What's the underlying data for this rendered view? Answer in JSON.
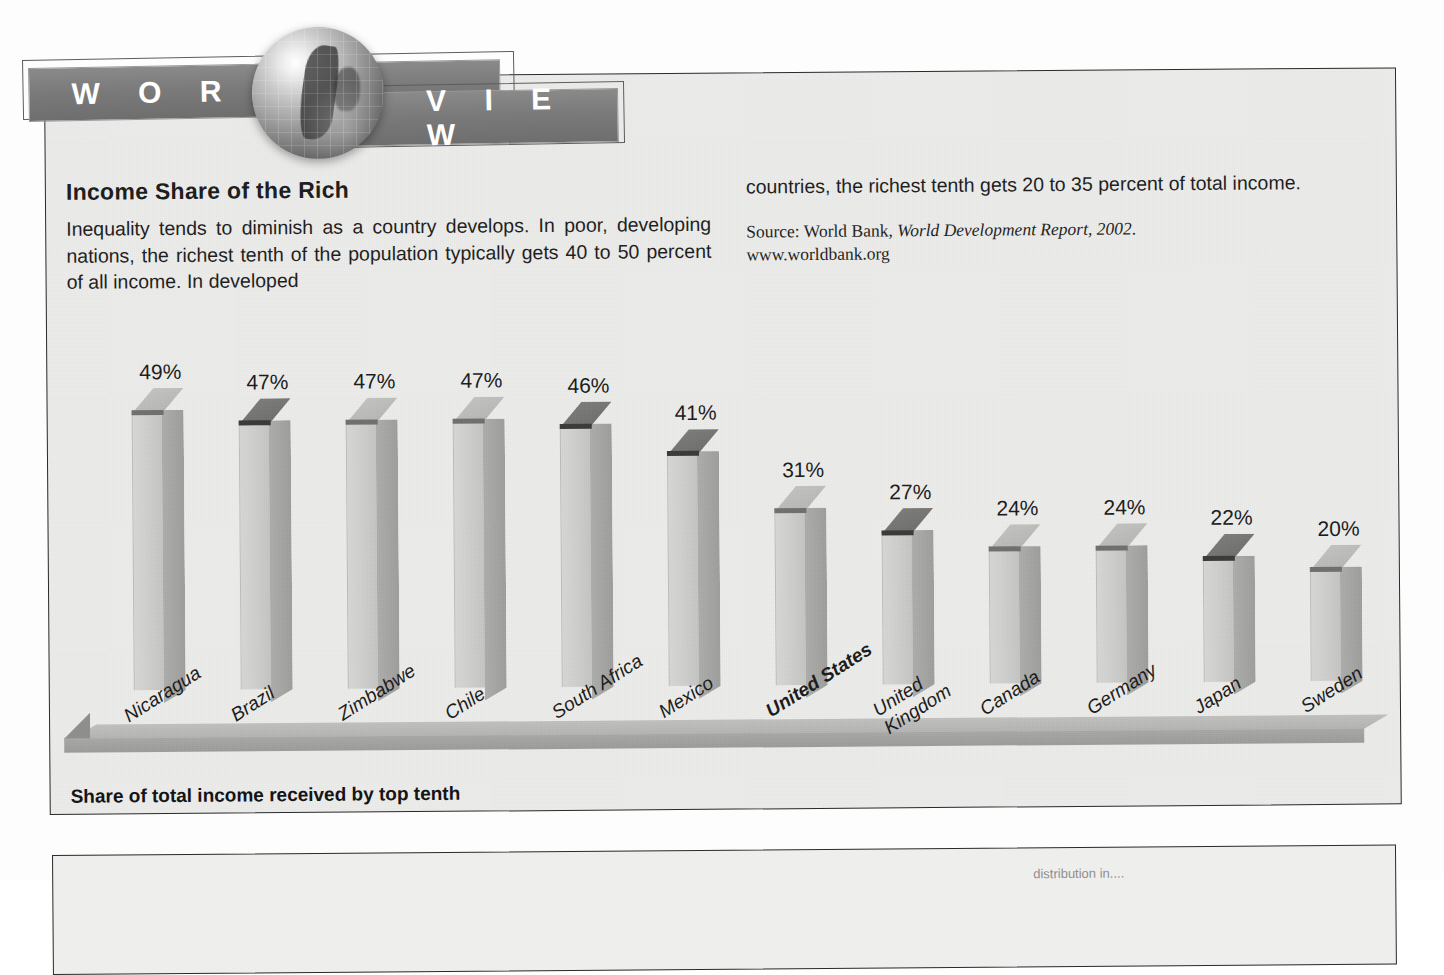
{
  "header": {
    "banner_left": "W O R L D",
    "banner_right": "V I E W",
    "globe_icon": "globe-icon"
  },
  "article": {
    "headline": "Income Share of the Rich",
    "lead_paragraph": "Inequality tends to diminish as a country develops. In poor, developing nations, the richest tenth of the population typically gets 40 to 50 percent of all income. In developed",
    "continuation": "countries, the richest tenth gets 20 to 35 percent of total income.",
    "source_prefix": "Source: World Bank, ",
    "source_title": "World Development Report, 2002",
    "source_suffix": ".",
    "source_url": "www.worldbank.org"
  },
  "chart_data": {
    "type": "bar",
    "title": "Income Share of the Rich",
    "xlabel": "",
    "ylabel": "Share of total income received by top tenth",
    "axis_caption": "Share of total income received by top tenth",
    "ylim": [
      0,
      50
    ],
    "grid": false,
    "legend": "none",
    "value_suffix": "%",
    "categories": [
      "Nicaragua",
      "Brazil",
      "Zimbabwe",
      "Chile",
      "South Africa",
      "Mexico",
      "United States",
      "United\nKingdom",
      "Canada",
      "Germany",
      "Japan",
      "Sweden"
    ],
    "values": [
      49,
      47,
      47,
      47,
      46,
      41,
      31,
      27,
      24,
      24,
      22,
      20
    ],
    "value_labels": [
      "49%",
      "47%",
      "47%",
      "47%",
      "46%",
      "41%",
      "31%",
      "27%",
      "24%",
      "24%",
      "22%",
      "20%"
    ],
    "highlighted_category": "United States",
    "top_face_shade": [
      "light",
      "dark",
      "light",
      "light",
      "dark",
      "dark",
      "light",
      "dark",
      "light",
      "light",
      "dark",
      "light"
    ]
  },
  "second_panel": {
    "ghost_text": "distribution in...."
  },
  "colors": {
    "panel_background": "#ececeb",
    "panel_border": "#2b2b2b",
    "banner_background": "#7a7a7a",
    "banner_text": "#ffffff",
    "bar_front": "#cdcdcb",
    "bar_side": "#9e9e9c",
    "bar_top_light": "#b2b2b0",
    "bar_top_dark": "#6a6a68",
    "text": "#1a1a1a"
  }
}
